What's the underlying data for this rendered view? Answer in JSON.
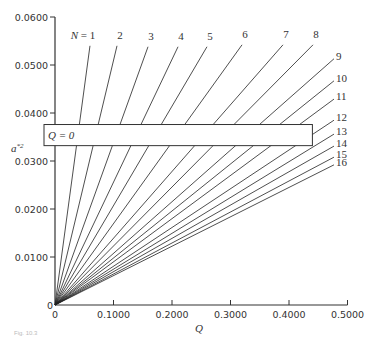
{
  "chart_data": {
    "type": "line",
    "title": "",
    "xlabel": "Q",
    "ylabel": "a*2",
    "xlim": [
      0,
      0.5
    ],
    "ylim": [
      0,
      0.06
    ],
    "x_ticks": [
      "0",
      "0.1000",
      "0.2000",
      "0.3000",
      "0.4000",
      "0.5000"
    ],
    "y_ticks": [
      "0",
      "0.0100",
      "0.0200",
      "0.0300",
      "0.0400",
      "0.0500",
      "0.0600"
    ],
    "grid": false,
    "legend": "inline line labels",
    "annotation": {
      "label": "Q = 0",
      "box": {
        "x0": -0.01,
        "x1": 0.44,
        "y0": 0.0332,
        "y1": 0.0376
      }
    },
    "series": [
      {
        "name": "N = 1",
        "x": [
          0,
          0.0598
        ],
        "y": [
          0,
          0.054
        ]
      },
      {
        "name": "2",
        "x": [
          0,
          0.106
        ],
        "y": [
          0,
          0.054
        ]
      },
      {
        "name": "3",
        "x": [
          0,
          0.159
        ],
        "y": [
          0,
          0.0538
        ]
      },
      {
        "name": "4",
        "x": [
          0,
          0.2103
        ],
        "y": [
          0,
          0.0538
        ]
      },
      {
        "name": "5",
        "x": [
          0,
          0.2598
        ],
        "y": [
          0,
          0.0538
        ]
      },
      {
        "name": "6",
        "x": [
          0,
          0.3197
        ],
        "y": [
          0,
          0.0542
        ]
      },
      {
        "name": "7",
        "x": [
          0,
          0.3897
        ],
        "y": [
          0,
          0.0542
        ]
      },
      {
        "name": "8",
        "x": [
          0,
          0.441
        ],
        "y": [
          0,
          0.0542
        ]
      },
      {
        "name": "9",
        "x": [
          0,
          0.4769
        ],
        "y": [
          0,
          0.0513
        ]
      },
      {
        "name": "10",
        "x": [
          0,
          0.4769
        ],
        "y": [
          0,
          0.0467
        ]
      },
      {
        "name": "11",
        "x": [
          0,
          0.4769
        ],
        "y": [
          0,
          0.0429
        ]
      },
      {
        "name": "12",
        "x": [
          0,
          0.4769
        ],
        "y": [
          0,
          0.0385
        ]
      },
      {
        "name": "13",
        "x": [
          0,
          0.4769
        ],
        "y": [
          0,
          0.0356
        ]
      },
      {
        "name": "14",
        "x": [
          0,
          0.4769
        ],
        "y": [
          0,
          0.0331
        ]
      },
      {
        "name": "15",
        "x": [
          0,
          0.4769
        ],
        "y": [
          0,
          0.0308
        ]
      },
      {
        "name": "16",
        "x": [
          0,
          0.4769
        ],
        "y": [
          0,
          0.0292
        ]
      }
    ]
  },
  "labels": {
    "n1": "N = 1",
    "box": "Q = 0",
    "xlabel": "Q",
    "ylabel": "a",
    "ylabel_sup": "*2",
    "caption": "Fig. 10.3"
  },
  "colors": {
    "axis": "#333333",
    "line": "#222222",
    "text": "#333333"
  }
}
